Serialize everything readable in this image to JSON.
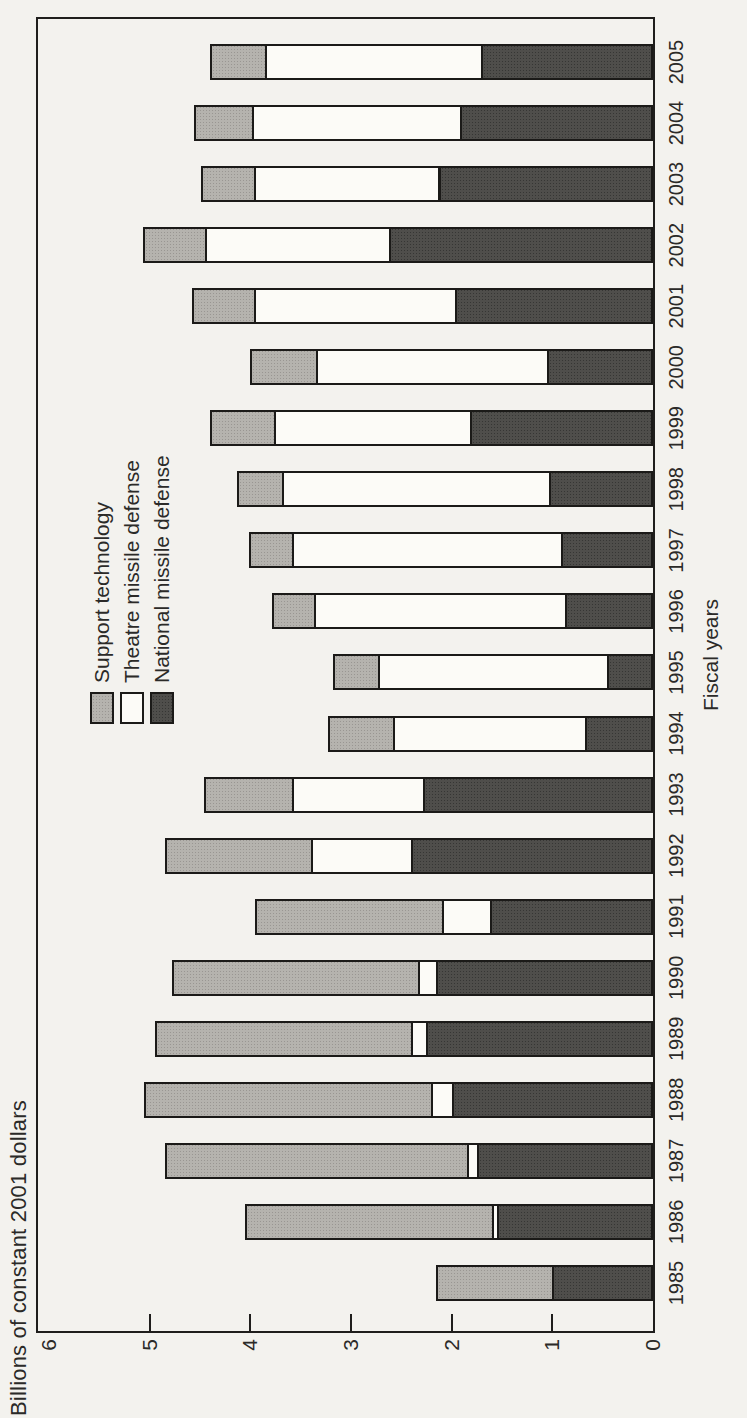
{
  "page": {
    "background": "#f3f2ee",
    "rotation_note": "landscape chart rotated 90deg counter-clockwise on portrait page"
  },
  "chart_data": {
    "type": "bar",
    "stacked": true,
    "title": "",
    "ylabel": "Billions of constant 2001 dollars",
    "xlabel": "Fiscal years",
    "ylim": [
      0,
      6
    ],
    "yticks": [
      0,
      1,
      2,
      3,
      4,
      5,
      6
    ],
    "grid": false,
    "legend_position": "upper-left-inside",
    "categories": [
      "1985",
      "1986",
      "1987",
      "1988",
      "1989",
      "1990",
      "1991",
      "1992",
      "1993",
      "1994",
      "1995",
      "1996",
      "1997",
      "1998",
      "1999",
      "2000",
      "2001",
      "2002",
      "2003",
      "2004",
      "2005"
    ],
    "stack_order_bottom_to_top": [
      "National missile defense",
      "Theatre missile defense",
      "Support technology"
    ],
    "series": [
      {
        "name": "Support technology",
        "color": "#b5b3ae",
        "css_class": "seg-gray",
        "values": [
          1.15,
          2.45,
          3.0,
          2.85,
          2.55,
          2.45,
          1.85,
          1.45,
          0.88,
          0.65,
          0.45,
          0.41,
          0.43,
          0.45,
          0.64,
          0.65,
          0.62,
          0.61,
          0.53,
          0.58,
          0.55
        ]
      },
      {
        "name": "Theatre missile defense",
        "color": "#fcfbf7",
        "css_class": "seg-white",
        "values": [
          0,
          0.05,
          0.1,
          0.2,
          0.15,
          0.18,
          0.48,
          1.0,
          1.3,
          1.9,
          2.27,
          2.5,
          2.67,
          2.65,
          1.94,
          2.3,
          1.99,
          1.83,
          1.83,
          2.06,
          2.14
        ]
      },
      {
        "name": "National missile defense",
        "color": "#4f4e4b",
        "css_class": "seg-dark",
        "values": [
          1.0,
          1.55,
          1.75,
          2.0,
          2.25,
          2.15,
          1.62,
          2.4,
          2.28,
          0.68,
          0.46,
          0.87,
          0.91,
          1.03,
          1.82,
          1.05,
          1.97,
          2.62,
          2.13,
          1.92,
          1.71
        ]
      }
    ]
  }
}
